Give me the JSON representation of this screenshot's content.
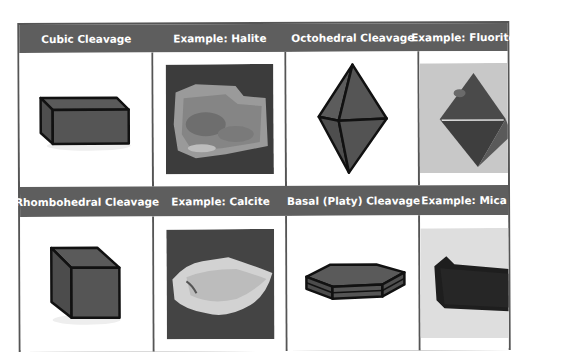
{
  "table": {
    "rows": [
      {
        "headers": [
          {
            "label": "Cubic Cleavage"
          },
          {
            "label": "Example: Halite"
          },
          {
            "label": "Octohedral Cleavage"
          },
          {
            "label": "Example: Fluorite"
          }
        ],
        "cells": [
          {
            "type": "diagram",
            "icon": "rectangular-prism-icon",
            "description": "Cubic cleavage block diagram"
          },
          {
            "type": "photo",
            "icon": "halite-photo",
            "description": "Halite specimen photo"
          },
          {
            "type": "diagram",
            "icon": "octahedron-icon",
            "description": "Octahedral cleavage diagram"
          },
          {
            "type": "photo",
            "icon": "fluorite-photo",
            "description": "Fluorite octahedron specimen photo"
          }
        ]
      },
      {
        "headers": [
          {
            "label": "Rhombohedral Cleavage"
          },
          {
            "label": "Example: Calcite"
          },
          {
            "label": "Basal (Platy) Cleavage"
          },
          {
            "label": "Example: Mica"
          }
        ],
        "cells": [
          {
            "type": "diagram",
            "icon": "rhombohedron-icon",
            "description": "Rhombohedral cleavage diagram"
          },
          {
            "type": "photo",
            "icon": "calcite-photo",
            "description": "Calcite specimen photo"
          },
          {
            "type": "diagram",
            "icon": "hexagonal-plate-icon",
            "description": "Basal platy cleavage diagram"
          },
          {
            "type": "photo",
            "icon": "mica-photo",
            "description": "Mica sheet specimen photo"
          }
        ]
      }
    ]
  },
  "colors": {
    "header_bg": "#5e5e5e",
    "header_text": "#ffffff",
    "border": "#555555",
    "shape_fill": "#555555",
    "shape_stroke": "#111111"
  }
}
